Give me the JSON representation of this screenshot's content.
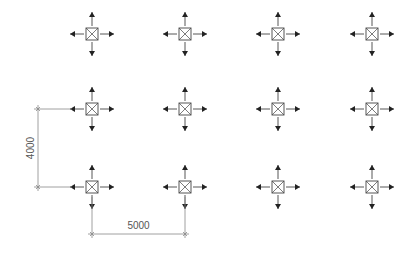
{
  "diagram": {
    "background": "#ffffff",
    "symbol_color": "#444444",
    "line_color": "#888888",
    "columns_x": [
      92,
      185,
      278,
      372
    ],
    "rows_y": [
      34,
      109,
      187
    ],
    "symbol": {
      "box_half": 6,
      "arrow_start": 8,
      "arrow_len": 14,
      "head_len": 5,
      "head_half": 3
    },
    "dimensions": {
      "horizontal": {
        "label": "5000",
        "x1": 92,
        "x2": 185,
        "y": 234,
        "ext_from_y": 197,
        "text_y": 229
      },
      "vertical": {
        "label": "4000",
        "y1": 109,
        "y2": 187,
        "x": 38,
        "ext_to_x": 72,
        "text_x": 34
      }
    }
  }
}
